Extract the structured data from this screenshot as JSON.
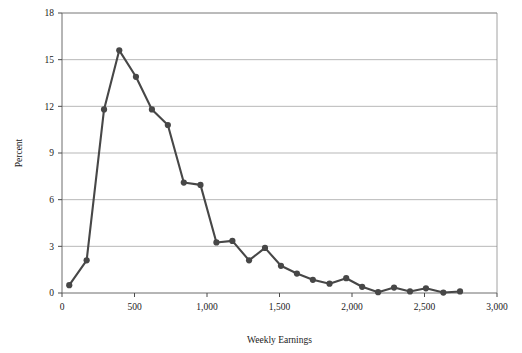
{
  "chart_data": {
    "type": "line",
    "title": "",
    "xlabel": "Weekly Earnings",
    "ylabel": "Percent",
    "xlim": [
      0,
      3000
    ],
    "ylim": [
      0,
      18
    ],
    "xticks": [
      0,
      500,
      1000,
      1500,
      2000,
      2500,
      3000
    ],
    "xtick_labels": [
      "0",
      "500",
      "1,000",
      "1,500",
      "2,000",
      "2,500",
      "3,000"
    ],
    "yticks": [
      0,
      3,
      6,
      9,
      12,
      15,
      18
    ],
    "ytick_labels": [
      "0",
      "3",
      "6",
      "9",
      "12",
      "15",
      "18"
    ],
    "grid": "horizontal",
    "legend": "none",
    "marker": "filled-circle",
    "series_color": "#474747",
    "x": [
      50,
      170,
      290,
      395,
      510,
      620,
      730,
      840,
      955,
      1065,
      1175,
      1290,
      1400,
      1510,
      1620,
      1730,
      1845,
      1960,
      2070,
      2180,
      2290,
      2400,
      2510,
      2630,
      2745
    ],
    "values": [
      0.5,
      2.1,
      11.8,
      15.6,
      13.9,
      11.8,
      10.8,
      7.1,
      6.95,
      3.25,
      3.35,
      2.1,
      2.9,
      1.75,
      1.25,
      0.85,
      0.6,
      0.95,
      0.4,
      0.05,
      0.35,
      0.1,
      0.3,
      0.03,
      0.1
    ],
    "series": [
      {
        "name": "Weekly Earnings Distribution",
        "values": [
          0.5,
          2.1,
          11.8,
          15.6,
          13.9,
          11.8,
          10.8,
          7.1,
          6.95,
          3.25,
          3.35,
          2.1,
          2.9,
          1.75,
          1.25,
          0.85,
          0.6,
          0.95,
          0.4,
          0.05,
          0.35,
          0.1,
          0.3,
          0.03,
          0.1
        ]
      }
    ]
  }
}
